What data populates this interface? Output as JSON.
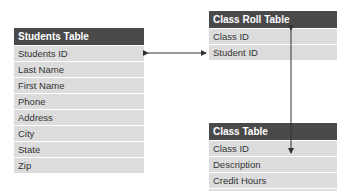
{
  "tables": {
    "students": {
      "title": "Students Table",
      "fields": [
        "Students ID",
        "Last Name",
        "First Name",
        "Phone",
        "Address",
        "City",
        "State",
        "Zip"
      ]
    },
    "class_roll": {
      "title": "Class Roll Table",
      "fields": [
        "Class ID",
        "Student ID"
      ]
    },
    "class": {
      "title": "Class Table",
      "fields": [
        "Class ID",
        "Description",
        "Credit Hours",
        "Instructor ID"
      ]
    }
  },
  "relationships": [
    {
      "from": "Students Table.Students ID",
      "to": "Class Roll Table.Student ID",
      "type": "bidirectional"
    },
    {
      "from": "Class Roll Table.Class ID",
      "to": "Class Table.Class ID",
      "type": "bidirectional"
    }
  ],
  "colors": {
    "header_bg": "#4a4a4a",
    "row_bg": "#dcdcdc",
    "text": "#333333",
    "arrow": "#333333"
  }
}
